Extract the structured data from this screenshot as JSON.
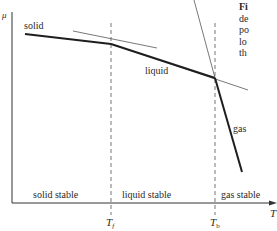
{
  "figure": {
    "y_axis_label": "μ",
    "x_axis_label": "T",
    "curve_labels": {
      "solid": "solid",
      "liquid": "liquid",
      "gas": "gas"
    },
    "region_labels": {
      "solid_stable": "solid stable",
      "liquid_stable": "liquid stable",
      "gas_stable": "gas stable"
    },
    "markers": {
      "tf_main": "T",
      "tf_sub": "f",
      "tb_main": "T",
      "tb_sub": "b"
    },
    "caption_fragments": [
      "Fi",
      "de",
      "po",
      "lo",
      "th"
    ]
  },
  "colors": {
    "thick_line": "#1e1e1e",
    "thin_line": "#555555",
    "axis": "#333333",
    "dashed": "#666666",
    "background": "#ffffff"
  }
}
